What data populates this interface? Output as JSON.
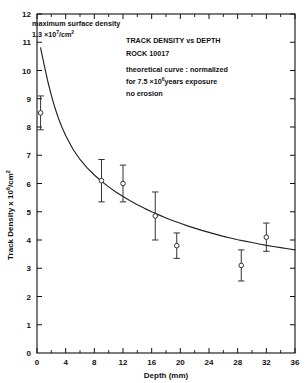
{
  "chart_data": {
    "type": "scatter",
    "title": "TRACK DENSITY vs DEPTH",
    "subtitle": "ROCK 10017",
    "xlabel": "Depth (mm)",
    "ylabel": "Track Density x 10⁶/cm²",
    "xlim": [
      0,
      36
    ],
    "ylim": [
      0,
      12
    ],
    "xticks": [
      0,
      4,
      8,
      12,
      16,
      20,
      24,
      28,
      32,
      36
    ],
    "xtick_labels": [
      "0",
      "4",
      "8",
      "12",
      "16",
      "20",
      "24",
      "28",
      "32",
      "36"
    ],
    "xticks_minor": [
      2,
      6,
      10,
      14,
      18,
      22,
      26,
      30,
      34
    ],
    "yticks": [
      1,
      2,
      3,
      4,
      5,
      6,
      7,
      8,
      9,
      10,
      11,
      12
    ],
    "ytick_labels": [
      "1",
      "2",
      "3",
      "4",
      "5",
      "6",
      "7",
      "8",
      "9",
      "10",
      "11",
      "12"
    ],
    "grid": false,
    "legend": "none",
    "series": [
      {
        "name": "measured track density",
        "type": "scatter",
        "marker": "open-circle",
        "points": [
          {
            "x": 0.5,
            "y": 8.5,
            "yerr": 0.6
          },
          {
            "x": 9.0,
            "y": 6.1,
            "yerr": 0.75
          },
          {
            "x": 12.0,
            "y": 6.0,
            "yerr": 0.65
          },
          {
            "x": 16.5,
            "y": 4.85,
            "yerr": 0.85
          },
          {
            "x": 19.5,
            "y": 3.8,
            "yerr": 0.45
          },
          {
            "x": 28.5,
            "y": 3.1,
            "yerr": 0.55
          },
          {
            "x": 32.0,
            "y": 4.1,
            "yerr": 0.5
          }
        ]
      },
      {
        "name": "theoretical curve",
        "type": "line",
        "points": [
          {
            "x": 0.5,
            "y": 10.8
          },
          {
            "x": 1.0,
            "y": 10.2
          },
          {
            "x": 1.5,
            "y": 9.62
          },
          {
            "x": 2.0,
            "y": 9.12
          },
          {
            "x": 2.5,
            "y": 8.68
          },
          {
            "x": 3.0,
            "y": 8.3
          },
          {
            "x": 3.5,
            "y": 7.98
          },
          {
            "x": 4.0,
            "y": 7.7
          },
          {
            "x": 5.0,
            "y": 7.22
          },
          {
            "x": 6.0,
            "y": 6.85
          },
          {
            "x": 7.0,
            "y": 6.55
          },
          {
            "x": 8.0,
            "y": 6.3
          },
          {
            "x": 9.0,
            "y": 6.08
          },
          {
            "x": 10.0,
            "y": 5.88
          },
          {
            "x": 11.0,
            "y": 5.7
          },
          {
            "x": 12.0,
            "y": 5.54
          },
          {
            "x": 13.0,
            "y": 5.39
          },
          {
            "x": 14.0,
            "y": 5.25
          },
          {
            "x": 15.0,
            "y": 5.12
          },
          {
            "x": 16.0,
            "y": 5.0
          },
          {
            "x": 17.0,
            "y": 4.89
          },
          {
            "x": 18.0,
            "y": 4.78
          },
          {
            "x": 19.0,
            "y": 4.68
          },
          {
            "x": 20.0,
            "y": 4.59
          },
          {
            "x": 21.0,
            "y": 4.5
          },
          {
            "x": 22.0,
            "y": 4.42
          },
          {
            "x": 23.0,
            "y": 4.34
          },
          {
            "x": 24.0,
            "y": 4.27
          },
          {
            "x": 25.0,
            "y": 4.2
          },
          {
            "x": 26.0,
            "y": 4.13
          },
          {
            "x": 27.0,
            "y": 4.07
          },
          {
            "x": 28.0,
            "y": 4.01
          },
          {
            "x": 29.0,
            "y": 3.96
          },
          {
            "x": 30.0,
            "y": 3.91
          },
          {
            "x": 31.0,
            "y": 3.86
          },
          {
            "x": 32.0,
            "y": 3.81
          },
          {
            "x": 33.0,
            "y": 3.77
          },
          {
            "x": 34.0,
            "y": 3.73
          },
          {
            "x": 35.0,
            "y": 3.69
          },
          {
            "x": 36.0,
            "y": 3.65
          }
        ]
      }
    ],
    "annotations": {
      "surface_density": {
        "line1": "maximum surface density",
        "line2_pre": "1.3 ×10",
        "line2_sup": "7",
        "line2_post": "/cm",
        "line2_post_sup": "2"
      },
      "title_block": {
        "line1": "TRACK  DENSITY  vs  DEPTH",
        "line2": "ROCK  10017",
        "line3": "theoretical curve : normalized",
        "line4_pre": "for  7.5 ×10",
        "line4_sup": "6",
        "line4_post": "years  exposure",
        "line5": "no erosion"
      }
    },
    "colors": {
      "axis": "#111111",
      "curve": "#222222",
      "marker_edge": "#333333",
      "marker_fill": "#ffffff",
      "background": "#ffffff"
    }
  }
}
